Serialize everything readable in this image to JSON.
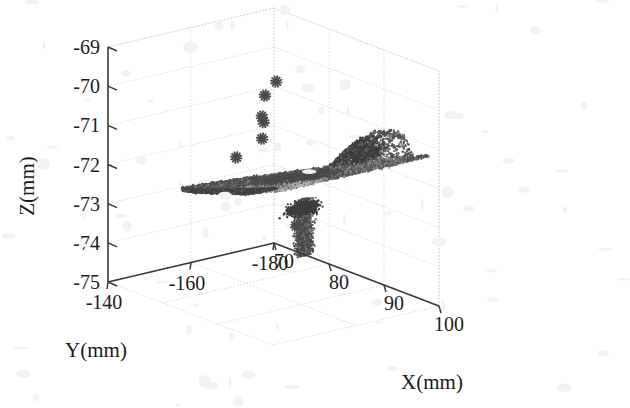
{
  "figure": {
    "kind": "3d-scatter-point-cloud",
    "background_color": "#ffffff",
    "point_color": "#4a4a4a",
    "marker_color": "#555555",
    "grid_color": "#d9d9d9",
    "axis_color": "#3a3a3a"
  },
  "axes": {
    "x": {
      "label": "X(mm)",
      "ticks": [
        "70",
        "80",
        "90",
        "100"
      ],
      "tick_values": [
        70,
        80,
        90,
        100
      ],
      "range": [
        70,
        100
      ]
    },
    "y": {
      "label": "Y(mm)",
      "ticks": [
        "-140",
        "-160",
        "-180"
      ],
      "tick_values": [
        -140,
        -160,
        -180
      ],
      "range": [
        -180,
        -140
      ]
    },
    "z": {
      "label": "Z(mm)",
      "ticks": [
        "-69",
        "-70",
        "-71",
        "-72",
        "-73",
        "-74",
        "-75"
      ],
      "tick_values": [
        -69,
        -70,
        -71,
        -72,
        -73,
        -74,
        -75
      ],
      "range": [
        -75,
        -69
      ]
    }
  },
  "chart_data": {
    "type": "scatter",
    "title": "",
    "xlabel": "X(mm)",
    "ylabel": "Y(mm)",
    "zlabel": "Z(mm)",
    "xlim": [
      70,
      100
    ],
    "ylim": [
      -180,
      -140
    ],
    "zlim": [
      -75,
      -69
    ],
    "xticks": [
      70,
      80,
      90,
      100
    ],
    "yticks": [
      -140,
      -160,
      -180
    ],
    "zticks": [
      -69,
      -70,
      -71,
      -72,
      -73,
      -74,
      -75
    ],
    "grid": true,
    "legend": "none",
    "view": {
      "azimuth": -37.5,
      "elevation": 22
    },
    "series": [
      {
        "name": "outlier-asterisks",
        "marker": "asterisk",
        "color": "#555555",
        "points": [
          {
            "x": 85.5,
            "y": -160.0,
            "z": -69.55
          },
          {
            "x": 84.2,
            "y": -159.0,
            "z": -69.95
          },
          {
            "x": 84.4,
            "y": -158.0,
            "z": -70.45
          },
          {
            "x": 85.0,
            "y": -157.6,
            "z": -70.55
          },
          {
            "x": 85.2,
            "y": -157.0,
            "z": -70.95
          },
          {
            "x": 82.0,
            "y": -155.0,
            "z": -71.55
          },
          {
            "x": 87.8,
            "y": -152.0,
            "z": -71.75
          },
          {
            "x": 78.5,
            "y": -174.0,
            "z": -73.95
          }
        ]
      },
      {
        "name": "main-surface-cloud",
        "marker": "dot",
        "color": "#4a4a4a",
        "description": "dense planar wedge sloping up to the right with a bumpy crest and a downward vertical spike near X=82",
        "n_points_approx": 9000,
        "plane": {
          "z_at_x70": -73.05,
          "z_at_x97": -71.35,
          "y_extent": [
            -178,
            -142
          ]
        },
        "crest": {
          "x_range": [
            88,
            94
          ],
          "z_peak": -71.05
        },
        "spike": {
          "x": 82.2,
          "y": -171.0,
          "z_range": [
            -74.45,
            -73.0
          ]
        }
      }
    ]
  }
}
